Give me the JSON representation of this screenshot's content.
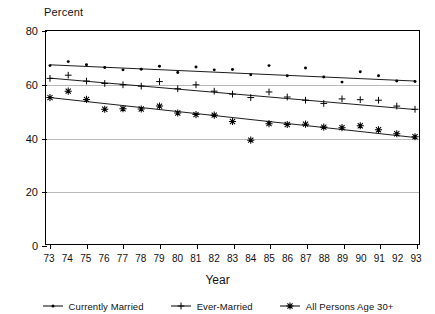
{
  "chart_data": {
    "type": "scatter",
    "title": "",
    "ylabel": "Percent",
    "xlabel": "Year",
    "ylim": [
      0,
      80
    ],
    "yticks": [
      0,
      20,
      40,
      60,
      80
    ],
    "gridlines": [
      20,
      40,
      60
    ],
    "grid": true,
    "legend_position": "bottom",
    "x": [
      73,
      74,
      75,
      76,
      77,
      78,
      79,
      80,
      81,
      82,
      83,
      84,
      85,
      86,
      87,
      88,
      89,
      90,
      91,
      92,
      93
    ],
    "xtick_labels": [
      "73",
      "74",
      "75",
      "76",
      "77",
      "78",
      "79",
      "80",
      "81",
      "82",
      "83",
      "84",
      "85",
      "86",
      "87",
      "88",
      "89",
      "90",
      "91",
      "92",
      "93"
    ],
    "series": [
      {
        "name": "Currently Married",
        "marker": "dot",
        "trendline": true,
        "trend_start": 67.3,
        "trend_end": 61.2,
        "values": [
          67.0,
          68.5,
          67.3,
          66.3,
          65.4,
          65.6,
          66.8,
          64.4,
          66.5,
          65.4,
          65.5,
          63.6,
          67.0,
          63.2,
          66.1,
          62.7,
          60.8,
          64.7,
          63.2,
          61.2,
          61.0
        ]
      },
      {
        "name": "Ever-Married",
        "marker": "plus",
        "trendline": true,
        "trend_start": 62.3,
        "trend_end": 50.5,
        "values": [
          62.2,
          63.4,
          61.2,
          60.3,
          59.8,
          59.3,
          61.0,
          58.3,
          59.8,
          57.4,
          56.3,
          55.0,
          57.1,
          55.2,
          54.0,
          52.8,
          54.5,
          54.2,
          54.0,
          51.8,
          50.6
        ]
      },
      {
        "name": "All Persons Age 30+",
        "marker": "asterisk",
        "trendline": true,
        "trend_start": 55.0,
        "trend_end": 40.0,
        "values": [
          55.0,
          57.4,
          54.3,
          50.6,
          50.8,
          50.7,
          51.8,
          49.2,
          48.6,
          48.4,
          46.0,
          39.0,
          45.2,
          44.9,
          45.0,
          43.9,
          43.7,
          44.4,
          42.9,
          41.4,
          40.3
        ]
      }
    ]
  },
  "legend": {
    "items": [
      {
        "label": "Currently Married",
        "marker": "dot"
      },
      {
        "label": "Ever-Married",
        "marker": "plus"
      },
      {
        "label": "All Persons Age 30+",
        "marker": "asterisk"
      }
    ]
  },
  "colors": {
    "ink": "#000000",
    "grid": "#b9b9b9",
    "background": "#ffffff"
  }
}
